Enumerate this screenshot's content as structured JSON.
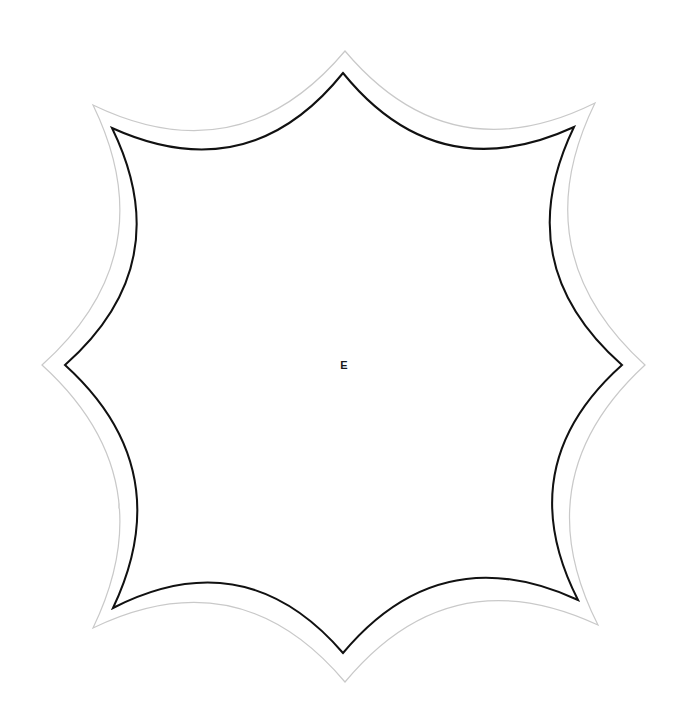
{
  "canvas": {
    "width": 688,
    "height": 727,
    "background_color": "#ffffff"
  },
  "figure": {
    "name": "octagonal-rosette-template",
    "center": {
      "x": 344,
      "y": 365
    },
    "center_label": "E",
    "inner_outline": {
      "stroke_color": "#111111",
      "stroke_width": 2.0,
      "fill": "none",
      "cusps": [
        {
          "name": "top",
          "x": 343,
          "y": 73
        },
        {
          "name": "top-right",
          "x": 574,
          "y": 127
        },
        {
          "name": "right",
          "x": 622,
          "y": 365
        },
        {
          "name": "bottom-right",
          "x": 578,
          "y": 600
        },
        {
          "name": "bottom",
          "x": 343,
          "y": 653
        },
        {
          "name": "bottom-left",
          "x": 113,
          "y": 608
        },
        {
          "name": "left",
          "x": 65,
          "y": 365
        },
        {
          "name": "top-left",
          "x": 112,
          "y": 128
        }
      ],
      "arc_sagitta": 46
    },
    "outer_outline": {
      "stroke_color": "#c9c9c9",
      "stroke_width": 1.2,
      "fill": "none",
      "offset_px": 26,
      "cusps": [
        {
          "name": "top",
          "x": 345,
          "y": 51
        },
        {
          "name": "top-right",
          "x": 595,
          "y": 103
        },
        {
          "name": "right",
          "x": 645,
          "y": 365
        },
        {
          "name": "bottom-right",
          "x": 598,
          "y": 625
        },
        {
          "name": "bottom",
          "x": 345,
          "y": 682
        },
        {
          "name": "bottom-left",
          "x": 93,
          "y": 628
        },
        {
          "name": "left",
          "x": 42,
          "y": 365
        },
        {
          "name": "top-left",
          "x": 93,
          "y": 105
        }
      ],
      "arc_sagitta": 50
    },
    "marks": [
      {
        "name": "faint-tick",
        "x": 119,
        "y": 506,
        "color": "#d8d8d8"
      }
    ]
  }
}
